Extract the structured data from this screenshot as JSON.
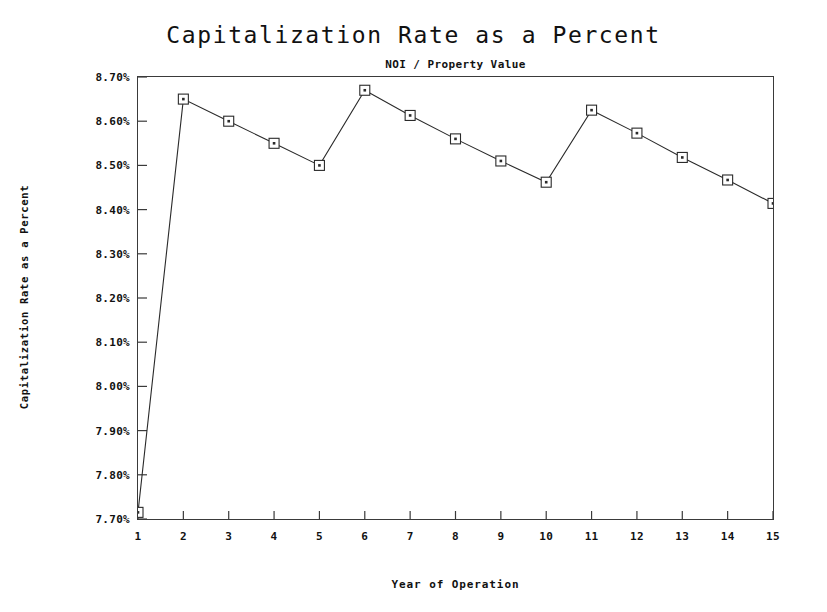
{
  "chart_data": {
    "type": "line",
    "title": "Capitalization Rate as a Percent",
    "subtitle": "NOI / Property Value",
    "xlabel": "Year of Operation",
    "ylabel": "Capitalization Rate as a Percent",
    "x": [
      1,
      2,
      3,
      4,
      5,
      6,
      7,
      8,
      9,
      10,
      11,
      12,
      13,
      14,
      15
    ],
    "categories": [
      "1",
      "2",
      "3",
      "4",
      "5",
      "6",
      "7",
      "8",
      "9",
      "10",
      "11",
      "12",
      "13",
      "14",
      "15"
    ],
    "values": [
      7.715,
      8.65,
      8.6,
      8.55,
      8.5,
      8.67,
      8.613,
      8.56,
      8.51,
      8.462,
      8.625,
      8.573,
      8.518,
      8.467,
      8.414
    ],
    "series": [
      {
        "name": "Capitalization Rate",
        "values": [
          7.715,
          8.65,
          8.6,
          8.55,
          8.5,
          8.67,
          8.613,
          8.56,
          8.51,
          8.462,
          8.625,
          8.573,
          8.518,
          8.467,
          8.414
        ]
      }
    ],
    "ylim": [
      7.7,
      8.7
    ],
    "xlim": [
      1,
      15
    ],
    "y_ticks": [
      7.7,
      7.8,
      7.9,
      8.0,
      8.1,
      8.2,
      8.3,
      8.4,
      8.5,
      8.6,
      8.7
    ],
    "y_tick_labels": [
      "7.70%",
      "7.80%",
      "7.90%",
      "8.00%",
      "8.10%",
      "8.20%",
      "8.30%",
      "8.40%",
      "8.50%",
      "8.60%",
      "8.70%"
    ],
    "x_tick_labels": [
      "1",
      "2",
      "3",
      "4",
      "5",
      "6",
      "7",
      "8",
      "9",
      "10",
      "11",
      "12",
      "13",
      "14",
      "15"
    ],
    "grid": false,
    "legend": "none",
    "marker": "open-square",
    "line_color": "#2a2a2a",
    "marker_color": "#2a2a2a",
    "background_color": "#ffffff",
    "frame_color": "#3a3a3a"
  }
}
